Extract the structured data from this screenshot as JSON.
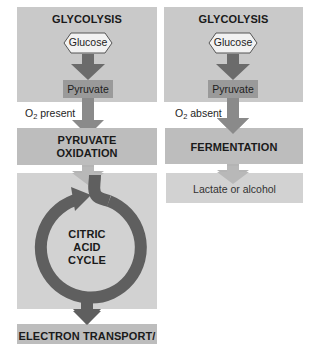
{
  "diagram": {
    "left_pathway": {
      "glycolysis_title": "GLYCOLYSIS",
      "glucose_label": "Glucose",
      "pyruvate_label": "Pyruvate",
      "condition_prefix": "O",
      "condition_subscript": "2",
      "condition_text": " present",
      "pyruvate_oxidation_line1": "PYRUVATE",
      "pyruvate_oxidation_line2": "OXIDATION",
      "citric_line1": "CITRIC",
      "citric_line2": "ACID",
      "citric_line3": "CYCLE",
      "electron_transport_label": "ELECTRON TRANSPORT/"
    },
    "right_pathway": {
      "glycolysis_title": "GLYCOLYSIS",
      "glucose_label": "Glucose",
      "pyruvate_label": "Pyruvate",
      "condition_prefix": "O",
      "condition_subscript": "2",
      "condition_text": " absent",
      "fermentation_label": "FERMENTATION",
      "product_label": "Lactate or alcohol"
    },
    "colors": {
      "panel": "#c9c9c9",
      "pyruvate_box": "#9a9a9a",
      "arrow_dark": "#6b6b6b",
      "arrow_light": "#b4b4b4",
      "cycle_arrow": "#5f5f5f",
      "hexagon_fill": "#f2f2f2"
    }
  }
}
